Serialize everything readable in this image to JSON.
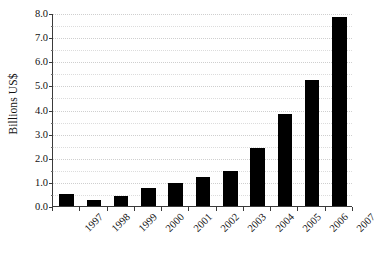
{
  "chart_data": {
    "type": "bar",
    "title": "",
    "subtitle": "",
    "xlabel": "",
    "ylabel": "Billions US$",
    "categories": [
      "1997",
      "1998",
      "1999",
      "2000",
      "2001",
      "2002",
      "2003",
      "2004",
      "2005",
      "2006",
      "2007"
    ],
    "values": [
      0.48,
      0.27,
      0.4,
      0.74,
      0.95,
      1.22,
      1.45,
      2.42,
      3.8,
      5.22,
      7.85
    ],
    "series": [
      {
        "name": "Billions US$",
        "values": [
          0.48,
          0.27,
          0.4,
          0.74,
          0.95,
          1.22,
          1.45,
          2.42,
          3.8,
          5.22,
          7.85
        ]
      }
    ],
    "ylim": [
      0.0,
      8.0
    ],
    "ytick_values": [
      0.0,
      1.0,
      2.0,
      3.0,
      4.0,
      5.0,
      6.0,
      7.0,
      8.0
    ],
    "ytick_labels": [
      "0.0",
      "1.0",
      "2.0",
      "3.0",
      "4.0",
      "5.0",
      "6.0",
      "7.0",
      "8.0"
    ],
    "minor_gridline_values": [
      0.5,
      1.5,
      2.5,
      3.5,
      4.5,
      5.5,
      6.5,
      7.5
    ],
    "grid": true,
    "grid_style": "dotted",
    "grid_color": "#cfcfcf",
    "legend": false,
    "legend_position": "none",
    "bar_color": "#000000",
    "axis_color": "#3a3a3a",
    "background_color": "#ffffff",
    "xtick_label_rotation": 45,
    "annotations": []
  }
}
